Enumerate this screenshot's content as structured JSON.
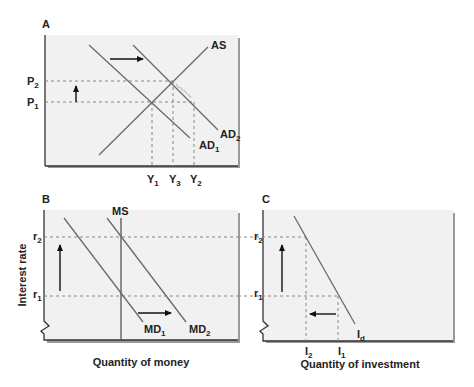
{
  "panels": {
    "A": {
      "label": "A",
      "curves": {
        "as": "AS",
        "ad1": "AD",
        "ad1_sub": "1",
        "ad2": "AD",
        "ad2_sub": "2"
      },
      "y_ticks": {
        "p2": "P",
        "p2_sub": "2",
        "p1": "P",
        "p1_sub": "1"
      },
      "x_ticks": {
        "y1": "Y",
        "y1_sub": "1",
        "y3": "Y",
        "y3_sub": "3",
        "y2": "Y",
        "y2_sub": "2"
      }
    },
    "B": {
      "label": "B",
      "y_axis_label": "Interest rate",
      "x_axis_label": "Quantity of money",
      "curves": {
        "ms": "MS",
        "md1": "MD",
        "md1_sub": "1",
        "md2": "MD",
        "md2_sub": "2"
      },
      "y_ticks": {
        "r2": "r",
        "r2_sub": "2",
        "r1": "r",
        "r1_sub": "1"
      }
    },
    "C": {
      "label": "C",
      "x_axis_label": "Quantity of investment",
      "curves": {
        "id": "I",
        "id_sub": "d"
      },
      "y_ticks": {
        "r2": "r",
        "r2_sub": "2",
        "r1": "r",
        "r1_sub": "1"
      },
      "x_ticks": {
        "i2": "I",
        "i2_sub": "2",
        "i1": "I",
        "i1_sub": "1"
      }
    }
  },
  "colors": {
    "panel_bg": "#f1f1f1",
    "line": "#6a6a6a",
    "axis": "#333333",
    "dash": "#888888",
    "arrow": "#111111",
    "shadow": "#9a9a9a"
  }
}
